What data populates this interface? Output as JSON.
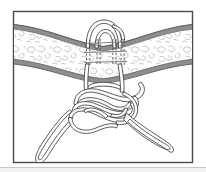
{
  "figure": {
    "title": "Surgical suture knot through tissue band",
    "illustration_type": "line-drawing",
    "frame": {
      "name": "illustration-border",
      "border_color": "#4a4a4a",
      "fill_color": "#ffffff",
      "x": 13,
      "y": 11,
      "width": 180,
      "height": 152
    },
    "top_strip": {
      "name": "page-edge-top",
      "color": "#e9e9e9",
      "height": 5
    },
    "bottom_strip": {
      "name": "page-edge-bottom",
      "color": "#f2f2f2",
      "height": 4
    },
    "colors": {
      "line": "#3c3c3c",
      "tissue_edge": "#8e8e8e",
      "tissue_fill": "#ffffff",
      "stipple": "#9a9a9a",
      "dashed_hidden": "#6b6b6b",
      "frame": "#4a4a4a",
      "background": "#ffffff"
    },
    "elements": [
      {
        "id": "tissue-band",
        "label": "Tissue band",
        "note": "Horizontal wavy band spanning the full width, pinched narrower at center where the suture compresses it. Bordered top and bottom by thick gray edges; interior filled with irregular stipple/cell texture."
      },
      {
        "id": "tissue-edge-upper",
        "label": "Upper tissue margin",
        "note": "Gray band edge running from upper-left down to the center then back up to the upper-right."
      },
      {
        "id": "tissue-edge-lower",
        "label": "Lower tissue margin",
        "note": "Gray band edge mirroring the upper margin."
      },
      {
        "id": "suture-hidden-pass",
        "label": "Suture passing behind tissue",
        "note": "Four near-vertical dashed strands crossing the tissue band at center, indicating the strand is hidden behind the tissue."
      },
      {
        "id": "suture-bight-loop",
        "label": "Suture bight above tissue",
        "note": "Rounded loop of strand emerging above the upper tissue margin."
      },
      {
        "id": "suture-knot",
        "label": "Interwoven knot",
        "note": "Multi-throw flat knot below the tissue with several over-under crossings."
      },
      {
        "id": "suture-tail-left",
        "label": "Left free tail",
        "note": "Strand descending to the lower-left and curving to a blunt end near the bottom-left of the frame."
      },
      {
        "id": "suture-tail-right",
        "label": "Right free tail",
        "note": "Strand descending to the lower-right and curving to a blunt end near the right edge of the frame."
      }
    ]
  }
}
